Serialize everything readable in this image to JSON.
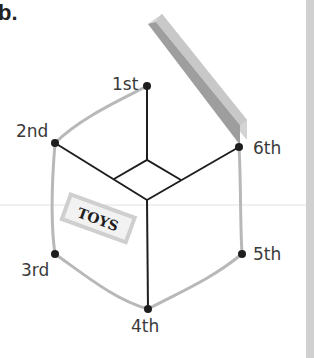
{
  "question_number": "b.",
  "box_label": "TOYS",
  "vertices": [
    {
      "label": "1st",
      "x": 147,
      "y": 86
    },
    {
      "label": "2nd",
      "x": 55,
      "y": 143
    },
    {
      "label": "3rd",
      "x": 55,
      "y": 254
    },
    {
      "label": "4th",
      "x": 148,
      "y": 309
    },
    {
      "label": "5th",
      "x": 242,
      "y": 254
    },
    {
      "label": "6th",
      "x": 239,
      "y": 147
    }
  ],
  "colors": {
    "edge": "#1e1e1e",
    "outline": "#b8b8b8",
    "lid_top": "#9a9a9a",
    "lid_edge": "#d2d2d2",
    "strip": "#d0d0d0"
  }
}
